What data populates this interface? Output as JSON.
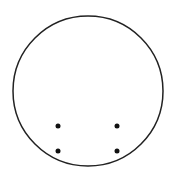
{
  "diagram": {
    "type": "circle-with-dots",
    "circle": {
      "cx": 88,
      "cy": 91,
      "r": 75,
      "stroke": "#222222",
      "stroke_width": 1.5,
      "fill": "#ffffff"
    },
    "dots": [
      {
        "cx": 58,
        "cy": 126,
        "r": 2.5
      },
      {
        "cx": 117,
        "cy": 126,
        "r": 2.5
      },
      {
        "cx": 58,
        "cy": 151,
        "r": 2.5
      },
      {
        "cx": 117,
        "cy": 151,
        "r": 2.5
      }
    ],
    "dot_color": "#111111"
  }
}
